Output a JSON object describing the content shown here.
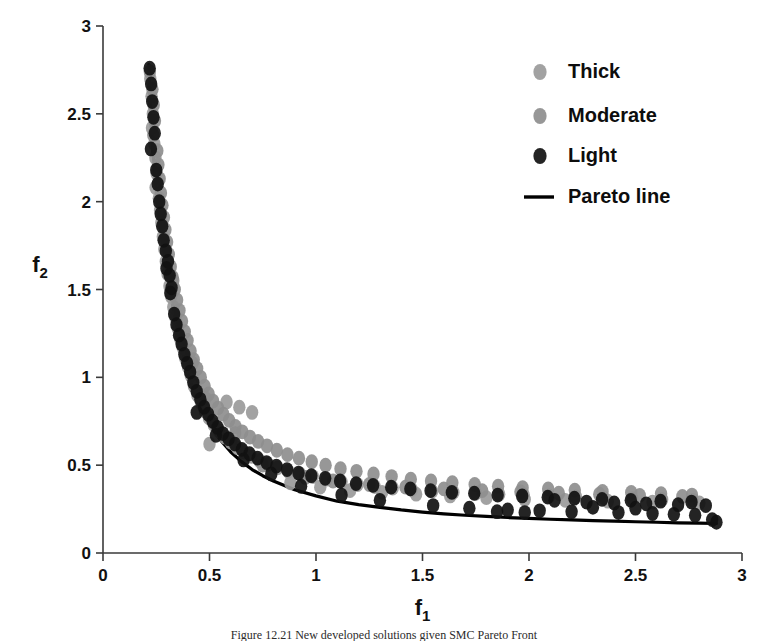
{
  "figure": {
    "background_color": "#ffffff",
    "axis_color": "#3a3a3a",
    "caption": "Figure 12.21   New developed solutions given SMC Pareto Front"
  },
  "chart_data": {
    "type": "scatter",
    "title": "",
    "xlabel": "f1",
    "ylabel": "f2",
    "xlabel_base": "f",
    "xlabel_sub": "1",
    "ylabel_base": "f",
    "ylabel_sub": "2",
    "xlim": [
      0,
      3
    ],
    "ylim": [
      0,
      3
    ],
    "xticks": [
      0,
      0.5,
      1,
      1.5,
      2,
      2.5,
      3
    ],
    "xtick_labels": [
      "0",
      "0.5",
      "1",
      "1.5",
      "2",
      "2.5",
      "3"
    ],
    "yticks": [
      0,
      0.5,
      1,
      1.5,
      2,
      2.5,
      3
    ],
    "ytick_labels": [
      "0",
      "0.5",
      "1",
      "1.5",
      "2",
      "2.5",
      "3"
    ],
    "grid": false,
    "legend_position": "top-right",
    "colors": {
      "thick": "#9a9a9a",
      "moderate": "#8e8e8e",
      "light": "#111111",
      "pareto_line": "#000000"
    },
    "legend": [
      {
        "label": "Thick",
        "marker": "circle",
        "color": "#9a9a9a"
      },
      {
        "label": "Moderate",
        "marker": "circle",
        "color": "#8e8e8e"
      },
      {
        "label": "Light",
        "marker": "circle",
        "color": "#111111"
      },
      {
        "label": "Pareto line",
        "marker": "line",
        "color": "#000000"
      }
    ],
    "pareto_line": {
      "name": "Pareto line",
      "points": [
        [
          0.215,
          2.78
        ],
        [
          0.225,
          2.45
        ],
        [
          0.24,
          2.2
        ],
        [
          0.255,
          2.0
        ],
        [
          0.275,
          1.8
        ],
        [
          0.3,
          1.6
        ],
        [
          0.325,
          1.42
        ],
        [
          0.35,
          1.27
        ],
        [
          0.375,
          1.14
        ],
        [
          0.4,
          1.02
        ],
        [
          0.43,
          0.91
        ],
        [
          0.46,
          0.82
        ],
        [
          0.5,
          0.73
        ],
        [
          0.55,
          0.645
        ],
        [
          0.6,
          0.575
        ],
        [
          0.65,
          0.52
        ],
        [
          0.7,
          0.475
        ],
        [
          0.75,
          0.44
        ],
        [
          0.8,
          0.41
        ],
        [
          0.9,
          0.36
        ],
        [
          1.0,
          0.325
        ],
        [
          1.1,
          0.295
        ],
        [
          1.2,
          0.275
        ],
        [
          1.3,
          0.26
        ],
        [
          1.4,
          0.245
        ],
        [
          1.5,
          0.233
        ],
        [
          1.6,
          0.223
        ],
        [
          1.7,
          0.215
        ],
        [
          1.8,
          0.208
        ],
        [
          1.9,
          0.202
        ],
        [
          2.0,
          0.197
        ],
        [
          2.1,
          0.192
        ],
        [
          2.2,
          0.188
        ],
        [
          2.3,
          0.184
        ],
        [
          2.4,
          0.181
        ],
        [
          2.5,
          0.178
        ],
        [
          2.6,
          0.175
        ],
        [
          2.7,
          0.172
        ],
        [
          2.8,
          0.17
        ],
        [
          2.88,
          0.168
        ]
      ]
    },
    "series": [
      {
        "name": "Thick",
        "marker": "circle",
        "color": "#9a9a9a",
        "points": [
          [
            0.222,
            2.7
          ],
          [
            0.228,
            2.6
          ],
          [
            0.234,
            2.5
          ],
          [
            0.23,
            2.42
          ],
          [
            0.241,
            2.33
          ],
          [
            0.246,
            2.25
          ],
          [
            0.252,
            2.16
          ],
          [
            0.247,
            2.08
          ],
          [
            0.262,
            2.02
          ],
          [
            0.268,
            1.95
          ],
          [
            0.274,
            1.88
          ],
          [
            0.281,
            1.8
          ],
          [
            0.288,
            1.73
          ],
          [
            0.295,
            1.66
          ],
          [
            0.303,
            1.59
          ],
          [
            0.312,
            1.52
          ],
          [
            0.32,
            1.46
          ],
          [
            0.33,
            1.4
          ],
          [
            0.34,
            1.34
          ],
          [
            0.351,
            1.28
          ],
          [
            0.363,
            1.22
          ],
          [
            0.374,
            1.17
          ],
          [
            0.386,
            1.11
          ],
          [
            0.399,
            1.06
          ],
          [
            0.412,
            1.01
          ],
          [
            0.427,
            0.95
          ],
          [
            0.443,
            0.9
          ],
          [
            0.46,
            0.855
          ],
          [
            0.478,
            0.81
          ],
          [
            0.497,
            0.77
          ],
          [
            0.52,
            0.73
          ],
          [
            0.545,
            0.695
          ],
          [
            0.572,
            0.66
          ],
          [
            0.6,
            0.63
          ],
          [
            0.63,
            0.6
          ],
          [
            0.662,
            0.575
          ],
          [
            0.697,
            0.55
          ],
          [
            0.735,
            0.525
          ],
          [
            0.775,
            0.505
          ],
          [
            0.82,
            0.485
          ],
          [
            0.87,
            0.465
          ],
          [
            0.925,
            0.45
          ],
          [
            0.985,
            0.435
          ],
          [
            1.05,
            0.42
          ],
          [
            1.12,
            0.405
          ],
          [
            1.195,
            0.39
          ],
          [
            1.275,
            0.378
          ],
          [
            1.36,
            0.37
          ],
          [
            1.45,
            0.36
          ],
          [
            1.545,
            0.352
          ],
          [
            1.645,
            0.345
          ],
          [
            1.75,
            0.34
          ],
          [
            1.86,
            0.335
          ],
          [
            1.975,
            0.33
          ],
          [
            2.095,
            0.325
          ],
          [
            2.22,
            0.32
          ],
          [
            2.35,
            0.315
          ],
          [
            2.485,
            0.31
          ],
          [
            2.625,
            0.305
          ],
          [
            2.77,
            0.3
          ],
          [
            0.58,
            0.86
          ],
          [
            0.64,
            0.83
          ],
          [
            0.7,
            0.8
          ],
          [
            0.5,
            0.62
          ],
          [
            0.88,
            0.4
          ],
          [
            1.02,
            0.375
          ],
          [
            1.16,
            0.355
          ],
          [
            1.31,
            0.345
          ],
          [
            1.47,
            0.335
          ],
          [
            1.63,
            0.325
          ],
          [
            1.8,
            0.315
          ],
          [
            1.98,
            0.305
          ],
          [
            2.17,
            0.3
          ],
          [
            2.37,
            0.295
          ],
          [
            2.58,
            0.29
          ],
          [
            2.8,
            0.285
          ]
        ]
      },
      {
        "name": "Moderate",
        "marker": "circle",
        "color": "#8e8e8e",
        "points": [
          [
            0.22,
            2.74
          ],
          [
            0.232,
            2.64
          ],
          [
            0.238,
            2.55
          ],
          [
            0.244,
            2.46
          ],
          [
            0.236,
            2.38
          ],
          [
            0.255,
            2.29
          ],
          [
            0.26,
            2.21
          ],
          [
            0.266,
            2.13
          ],
          [
            0.272,
            2.05
          ],
          [
            0.279,
            1.98
          ],
          [
            0.286,
            1.91
          ],
          [
            0.293,
            1.84
          ],
          [
            0.301,
            1.77
          ],
          [
            0.309,
            1.7
          ],
          [
            0.318,
            1.63
          ],
          [
            0.327,
            1.57
          ],
          [
            0.337,
            1.5
          ],
          [
            0.348,
            1.44
          ],
          [
            0.359,
            1.38
          ],
          [
            0.371,
            1.32
          ],
          [
            0.384,
            1.26
          ],
          [
            0.397,
            1.21
          ],
          [
            0.411,
            1.15
          ],
          [
            0.426,
            1.1
          ],
          [
            0.442,
            1.05
          ],
          [
            0.459,
            1.0
          ],
          [
            0.477,
            0.95
          ],
          [
            0.496,
            0.905
          ],
          [
            0.517,
            0.865
          ],
          [
            0.54,
            0.825
          ],
          [
            0.565,
            0.79
          ],
          [
            0.592,
            0.755
          ],
          [
            0.622,
            0.72
          ],
          [
            0.654,
            0.69
          ],
          [
            0.69,
            0.66
          ],
          [
            0.728,
            0.635
          ],
          [
            0.77,
            0.61
          ],
          [
            0.816,
            0.585
          ],
          [
            0.866,
            0.56
          ],
          [
            0.92,
            0.54
          ],
          [
            0.98,
            0.52
          ],
          [
            1.045,
            0.5
          ],
          [
            1.115,
            0.48
          ],
          [
            1.19,
            0.465
          ],
          [
            1.27,
            0.45
          ],
          [
            1.355,
            0.435
          ],
          [
            1.445,
            0.42
          ],
          [
            1.54,
            0.41
          ],
          [
            1.64,
            0.4
          ],
          [
            1.745,
            0.39
          ],
          [
            1.855,
            0.38
          ],
          [
            1.97,
            0.372
          ],
          [
            2.09,
            0.365
          ],
          [
            2.215,
            0.358
          ],
          [
            2.345,
            0.35
          ],
          [
            2.48,
            0.345
          ],
          [
            2.62,
            0.338
          ],
          [
            2.765,
            0.33
          ],
          [
            0.33,
            1.55
          ],
          [
            0.42,
            1.08
          ],
          [
            0.48,
            0.88
          ],
          [
            0.62,
            0.68
          ],
          [
            0.75,
            0.5
          ],
          [
            0.95,
            0.43
          ],
          [
            1.08,
            0.41
          ],
          [
            1.25,
            0.39
          ],
          [
            1.42,
            0.375
          ],
          [
            1.6,
            0.365
          ],
          [
            1.78,
            0.355
          ],
          [
            1.96,
            0.348
          ],
          [
            2.14,
            0.34
          ],
          [
            2.33,
            0.335
          ],
          [
            2.52,
            0.328
          ],
          [
            2.72,
            0.322
          ]
        ]
      },
      {
        "name": "Light",
        "marker": "circle",
        "color": "#111111",
        "points": [
          [
            0.219,
            2.76
          ],
          [
            0.226,
            2.67
          ],
          [
            0.231,
            2.57
          ],
          [
            0.237,
            2.48
          ],
          [
            0.243,
            2.39
          ],
          [
            0.225,
            2.3
          ],
          [
            0.25,
            2.18
          ],
          [
            0.257,
            2.1
          ],
          [
            0.264,
            2.0
          ],
          [
            0.271,
            1.93
          ],
          [
            0.278,
            1.86
          ],
          [
            0.285,
            1.78
          ],
          [
            0.298,
            1.62
          ],
          [
            0.316,
            1.48
          ],
          [
            0.334,
            1.36
          ],
          [
            0.345,
            1.3
          ],
          [
            0.357,
            1.24
          ],
          [
            0.369,
            1.19
          ],
          [
            0.382,
            1.13
          ],
          [
            0.395,
            1.08
          ],
          [
            0.409,
            1.03
          ],
          [
            0.424,
            0.97
          ],
          [
            0.44,
            0.92
          ],
          [
            0.457,
            0.875
          ],
          [
            0.475,
            0.83
          ],
          [
            0.494,
            0.79
          ],
          [
            0.515,
            0.75
          ],
          [
            0.538,
            0.715
          ],
          [
            0.563,
            0.68
          ],
          [
            0.59,
            0.65
          ],
          [
            0.62,
            0.62
          ],
          [
            0.652,
            0.59
          ],
          [
            0.688,
            0.565
          ],
          [
            0.726,
            0.54
          ],
          [
            0.768,
            0.515
          ],
          [
            0.814,
            0.495
          ],
          [
            0.864,
            0.475
          ],
          [
            0.918,
            0.455
          ],
          [
            0.978,
            0.44
          ],
          [
            1.043,
            0.425
          ],
          [
            1.113,
            0.41
          ],
          [
            1.188,
            0.395
          ],
          [
            1.268,
            0.385
          ],
          [
            1.353,
            0.375
          ],
          [
            1.443,
            0.365
          ],
          [
            1.538,
            0.355
          ],
          [
            1.638,
            0.345
          ],
          [
            1.743,
            0.34
          ],
          [
            1.853,
            0.33
          ],
          [
            1.968,
            0.325
          ],
          [
            2.088,
            0.318
          ],
          [
            2.213,
            0.312
          ],
          [
            2.343,
            0.305
          ],
          [
            2.478,
            0.3
          ],
          [
            2.618,
            0.295
          ],
          [
            2.763,
            0.29
          ],
          [
            0.295,
            1.72
          ],
          [
            0.305,
            1.66
          ],
          [
            0.313,
            1.58
          ],
          [
            0.322,
            1.51
          ],
          [
            0.44,
            0.8
          ],
          [
            0.53,
            0.67
          ],
          [
            0.66,
            0.53
          ],
          [
            0.79,
            0.45
          ],
          [
            0.93,
            0.38
          ],
          [
            1.12,
            0.33
          ],
          [
            1.3,
            0.3
          ],
          [
            1.55,
            0.27
          ],
          [
            1.72,
            0.255
          ],
          [
            1.9,
            0.245
          ],
          [
            2.05,
            0.24
          ],
          [
            2.2,
            0.235
          ],
          [
            2.3,
            0.26
          ],
          [
            2.42,
            0.23
          ],
          [
            2.5,
            0.255
          ],
          [
            2.58,
            0.225
          ],
          [
            2.68,
            0.22
          ],
          [
            2.78,
            0.215
          ],
          [
            2.86,
            0.19
          ],
          [
            2.88,
            0.175
          ],
          [
            2.12,
            0.3
          ],
          [
            2.27,
            0.29
          ],
          [
            2.4,
            0.285
          ],
          [
            2.55,
            0.28
          ],
          [
            2.7,
            0.275
          ],
          [
            2.83,
            0.27
          ],
          [
            1.85,
            0.235
          ],
          [
            1.98,
            0.23
          ]
        ]
      }
    ]
  }
}
